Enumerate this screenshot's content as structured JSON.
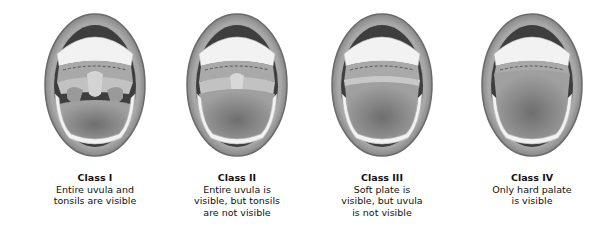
{
  "classes": [
    {
      "title": "Class I",
      "desc": "Entire uvula and\ntonsils are visible",
      "cx": 95
    },
    {
      "title": "Class II",
      "desc": "Entire uvula is\nvisible, but tonsils\nare not visible",
      "cx": 237
    },
    {
      "title": "Class III",
      "desc": "Soft plate is\nvisible, but uvula\nis not visible",
      "cx": 382
    },
    {
      "title": "Class IV",
      "desc": "Only hard palate\nis visible",
      "cx": 532
    }
  ],
  "colors": {
    "lip": "#8a8a8a",
    "lip_dark": "#5e5e5e",
    "cavity": "#4a4a4a",
    "palate": "#b8b8b8",
    "tongue": "#8c8c8c",
    "teeth": "#f4f4f4"
  }
}
